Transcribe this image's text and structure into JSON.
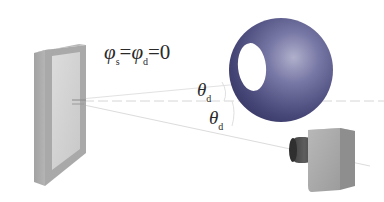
{
  "diagram": {
    "labels": {
      "phi_equation": {
        "phi1": "φ",
        "phi1_sub": "s",
        "eq1": "=",
        "phi2": "φ",
        "phi2_sub": "d",
        "eq2": "=0"
      },
      "theta_upper": {
        "symbol": "θ",
        "sub": "d"
      },
      "theta_lower": {
        "symbol": "θ",
        "sub": "d"
      }
    },
    "components": {
      "light_panel": "flat illuminated panel",
      "sphere": "sphere with circular opening",
      "camera": "camera"
    },
    "colors": {
      "sphere": "#4a4a7e",
      "sphere_highlight": "#9a9ac0",
      "panel_frame": "#9c9c9c",
      "panel_face": "#d2d2d2",
      "camera_body": "#a8a8a8",
      "camera_lens": "#4a4a4a",
      "guide_lines": "#d8d8d8"
    }
  }
}
